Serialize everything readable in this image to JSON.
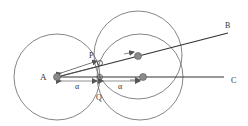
{
  "diagram": {
    "colors": {
      "stroke": "#444444",
      "light_stroke": "#777777",
      "dot_fill": "#8a8a8a",
      "dot_stroke": "#555555",
      "label": "#333333",
      "background": "#ffffff"
    },
    "labels": {
      "A": "A",
      "B": "B",
      "C": "C",
      "P": "P",
      "Q": "Q",
      "alpha_left": "α",
      "alpha_right": "α"
    },
    "points": {
      "A": {
        "x": 57,
        "y": 77
      },
      "B_end": {
        "x": 228,
        "y": 33
      },
      "C_end": {
        "x": 224,
        "y": 77
      },
      "dot_on_AB": {
        "x": 138,
        "y": 56
      },
      "dot_on_AC": {
        "x": 143,
        "y": 77
      },
      "P": {
        "x": 100,
        "y": 62
      },
      "Q": {
        "x": 100,
        "y": 77
      }
    },
    "circles": [
      {
        "name": "circle-around-A",
        "cx": 57,
        "cy": 77,
        "r": 43
      },
      {
        "name": "circle-around-AB-dot",
        "cx": 138,
        "cy": 55,
        "r": 44
      },
      {
        "name": "circle-around-AC-dot",
        "cx": 140,
        "cy": 77,
        "r": 43
      }
    ]
  }
}
